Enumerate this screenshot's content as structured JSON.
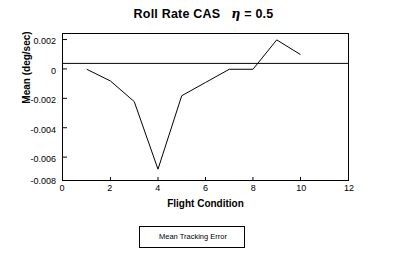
{
  "chart_data": {
    "type": "line",
    "title_main": "Roll Rate CAS",
    "title_eta": "η",
    "title_eta_value": "= 0.5",
    "xlabel": "Flight Condition",
    "ylabel": "Mean  (deg/sec)",
    "xlim": [
      0,
      12
    ],
    "ylim": [
      -0.008,
      0.002
    ],
    "xticks": [
      0,
      2,
      4,
      6,
      8,
      10,
      12
    ],
    "xticklabels": [
      "0",
      "2",
      "4",
      "6",
      "8",
      "10",
      "12"
    ],
    "yticks": [
      -0.008,
      -0.006,
      -0.004,
      -0.002,
      0,
      0.002
    ],
    "yticklabels": [
      "-0.008",
      "-0.006",
      "-0.004",
      "-0.002",
      "0",
      "0.002"
    ],
    "grid": false,
    "legend_position": "below-plot-center",
    "series": [
      {
        "name": "Mean Tracking Error",
        "color": "#000000",
        "x": [
          1,
          2,
          3,
          4,
          5,
          6,
          7,
          8,
          9,
          10
        ],
        "values": [
          -0.0004,
          -0.0012,
          -0.0026,
          -0.0072,
          -0.0022,
          -0.0013,
          -0.0004,
          -0.0004,
          0.0016,
          0.0006
        ]
      }
    ],
    "zero_line": 0
  },
  "legend": {
    "entries": [
      {
        "label": "Mean Tracking Error"
      }
    ]
  }
}
